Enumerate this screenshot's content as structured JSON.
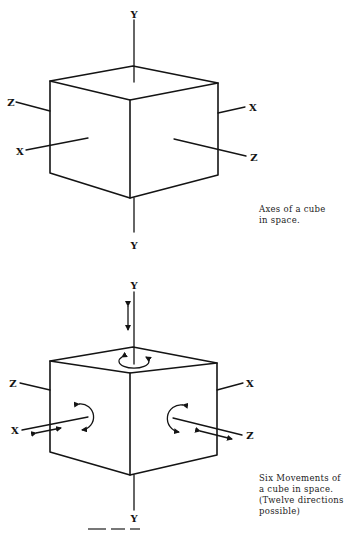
{
  "figure": {
    "top_panel": {
      "axis_labels": {
        "y_top": "Y",
        "y_bottom": "Y",
        "z_left": "Z",
        "x_left": "X",
        "x_right": "X",
        "z_right": "Z"
      },
      "caption_lines": [
        "Axes of a cube",
        "in space."
      ]
    },
    "bottom_panel": {
      "axis_labels": {
        "y_top": "Y",
        "y_bottom": "Y",
        "z_left": "Z",
        "x_left": "X",
        "x_right": "X",
        "z_right": "Z"
      },
      "movement_indicators": [
        "translation-y",
        "rotation-y",
        "translation-x",
        "rotation-x",
        "translation-z",
        "rotation-z"
      ],
      "caption_lines": [
        "Six Movements of",
        "a cube in space.",
        "(Twelve directions",
        "possible)"
      ]
    },
    "colors": {
      "ink": "#141414",
      "background": "#ffffff"
    }
  }
}
